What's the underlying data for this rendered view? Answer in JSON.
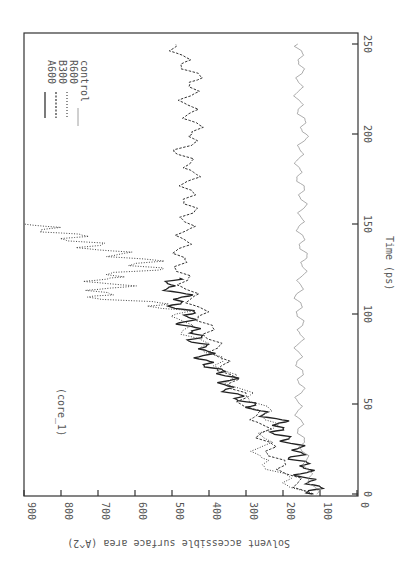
{
  "chart_data": {
    "type": "line",
    "orientation": "rotated 90 degrees clockwise on page",
    "title": "",
    "annotation": "(core_1)",
    "xlabel": "Time (ps)",
    "ylabel": "Solvent accessible surface area (A^2)",
    "xlim": [
      0,
      250
    ],
    "ylim": [
      0,
      900
    ],
    "xticks": [
      "0",
      "50",
      "100",
      "150",
      "200",
      "250"
    ],
    "yticks": [
      "0",
      "100",
      "200",
      "300",
      "400",
      "500",
      "600",
      "700",
      "800",
      "900"
    ],
    "grid": false,
    "legend_position": "upper right (inside plot)",
    "series": [
      {
        "name": "A600",
        "style": "solid",
        "color": "#222222",
        "x": [
          0,
          5,
          10,
          15,
          20,
          25,
          30,
          35,
          40,
          45,
          50,
          55,
          60,
          65,
          70,
          75,
          80,
          85,
          90,
          95,
          100,
          105,
          110,
          115,
          120
        ],
        "values": [
          120,
          110,
          150,
          130,
          170,
          150,
          190,
          220,
          200,
          260,
          290,
          330,
          360,
          340,
          390,
          420,
          400,
          440,
          430,
          470,
          440,
          500,
          460,
          520,
          480
        ]
      },
      {
        "name": "B300",
        "style": "dashed",
        "color": "#333333",
        "x": [
          0,
          10,
          20,
          30,
          40,
          50,
          60,
          70,
          80,
          90,
          100,
          110,
          120,
          130,
          140,
          150,
          160,
          170,
          180,
          190,
          200,
          210,
          220,
          230,
          240,
          250
        ],
        "values": [
          130,
          180,
          220,
          250,
          260,
          300,
          330,
          360,
          380,
          400,
          420,
          450,
          470,
          480,
          470,
          460,
          450,
          460,
          440,
          480,
          430,
          450,
          460,
          430,
          470,
          490
        ]
      },
      {
        "name": "R600",
        "style": "dotted",
        "color": "#444444",
        "x": [
          0,
          10,
          20,
          30,
          40,
          50,
          60,
          70,
          80,
          90,
          100,
          105,
          110,
          115,
          120,
          125,
          130,
          135,
          140,
          145,
          150
        ],
        "values": [
          150,
          200,
          270,
          250,
          230,
          260,
          330,
          360,
          400,
          460,
          480,
          520,
          720,
          650,
          700,
          560,
          580,
          680,
          740,
          790,
          900
        ]
      },
      {
        "name": "control",
        "style": "thin solid",
        "color": "#777777",
        "x": [
          0,
          10,
          20,
          30,
          40,
          50,
          60,
          70,
          80,
          90,
          100,
          110,
          120,
          130,
          140,
          150,
          160,
          170,
          180,
          190,
          200,
          210,
          220,
          230,
          240,
          250
        ],
        "values": [
          110,
          130,
          140,
          150,
          155,
          160,
          150,
          155,
          160,
          150,
          155,
          160,
          150,
          140,
          150,
          155,
          145,
          150,
          160,
          155,
          140,
          150,
          160,
          155,
          150,
          160
        ]
      }
    ]
  },
  "labels": {
    "annotation": "(core_1)",
    "xlabel": "Time (ps)",
    "ylabel": "Solvent accessible surface area (A^2)",
    "legend": [
      "A600",
      "B300",
      "R600",
      "control"
    ],
    "xticks": [
      "0",
      "50",
      "100",
      "150",
      "200",
      "250"
    ],
    "yticks": [
      "900",
      "800",
      "700",
      "600",
      "500",
      "400",
      "300",
      "200",
      "100",
      "0"
    ]
  }
}
